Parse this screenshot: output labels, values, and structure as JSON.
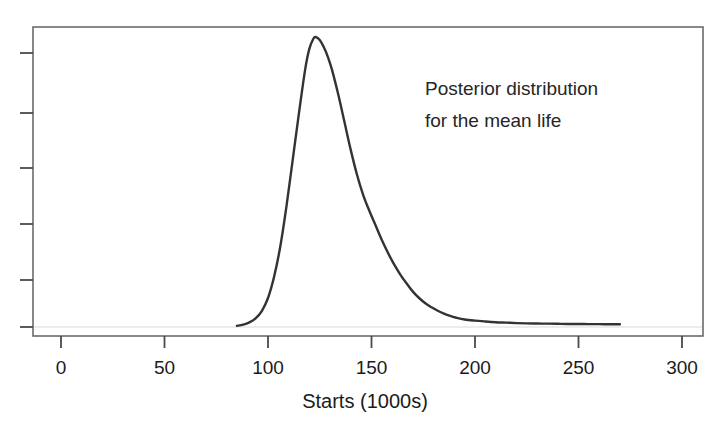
{
  "chart_data": {
    "type": "line",
    "title": "",
    "subtitle": "",
    "xlabel": "Starts (1000s)",
    "ylabel": "",
    "xlim": [
      0,
      300
    ],
    "ylim": [
      0,
      1.08
    ],
    "grid": false,
    "legend": null,
    "xticks": [
      0,
      50,
      100,
      150,
      200,
      250,
      300
    ],
    "xtick_labels": [
      "0",
      "50",
      "100",
      "150",
      "200",
      "250",
      "300"
    ],
    "ytick_count": 6,
    "ytick_labels": [],
    "annotations": [
      {
        "name": "posterior-annotation",
        "lines": [
          "Posterior distribution",
          "for the mean life"
        ],
        "x": 190,
        "y": 0.88
      }
    ],
    "series": [
      {
        "name": "posterior density for mean life",
        "color": "#333333",
        "x": [
          85,
          88,
          91,
          94,
          97,
          100,
          103,
          106,
          109,
          112,
          115,
          118,
          120,
          122,
          123,
          125,
          127,
          129,
          131,
          134,
          137,
          140,
          143,
          146,
          149,
          152,
          155,
          158,
          161,
          164,
          167,
          170,
          173,
          176,
          179,
          182,
          185,
          188,
          191,
          195,
          200,
          205,
          210,
          215,
          220,
          225,
          230,
          235,
          240,
          245,
          250,
          255,
          260,
          265,
          270
        ],
        "y": [
          0.004,
          0.008,
          0.016,
          0.03,
          0.055,
          0.1,
          0.175,
          0.28,
          0.42,
          0.58,
          0.74,
          0.89,
          0.96,
          0.995,
          1.0,
          0.99,
          0.965,
          0.93,
          0.885,
          0.8,
          0.705,
          0.61,
          0.525,
          0.455,
          0.4,
          0.35,
          0.3,
          0.255,
          0.215,
          0.18,
          0.15,
          0.122,
          0.1,
          0.082,
          0.068,
          0.056,
          0.046,
          0.038,
          0.032,
          0.026,
          0.022,
          0.019,
          0.0165,
          0.015,
          0.0135,
          0.0125,
          0.012,
          0.0115,
          0.011,
          0.0105,
          0.0105,
          0.01,
          0.01,
          0.0095,
          0.0095
        ]
      }
    ]
  },
  "axes": {
    "baseline_rule_color": "#d9d9d9",
    "frame_color": "#6b6b6b",
    "tick_color": "#4a4a4a"
  }
}
